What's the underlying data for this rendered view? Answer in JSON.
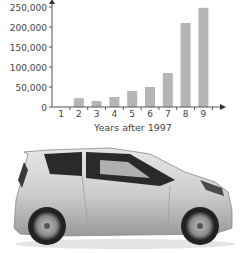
{
  "chart_data": {
    "type": "bar",
    "title": "",
    "xlabel": "Years after 1997",
    "ylabel": "",
    "categories": [
      "1",
      "2",
      "3",
      "4",
      "5",
      "6",
      "7",
      "8",
      "9"
    ],
    "values": [
      500,
      22000,
      15000,
      25000,
      40000,
      50000,
      85000,
      210000,
      248000
    ],
    "yticks": [
      "0",
      "50,000",
      "100,000",
      "150,000",
      "200,000",
      "250,000"
    ],
    "ylim": [
      0,
      250000
    ],
    "grid": false,
    "legend": null,
    "bar_color": "#b5b5b5"
  },
  "image": {
    "subject": "car-photo",
    "description": "Silver compact hatchback, side view"
  }
}
